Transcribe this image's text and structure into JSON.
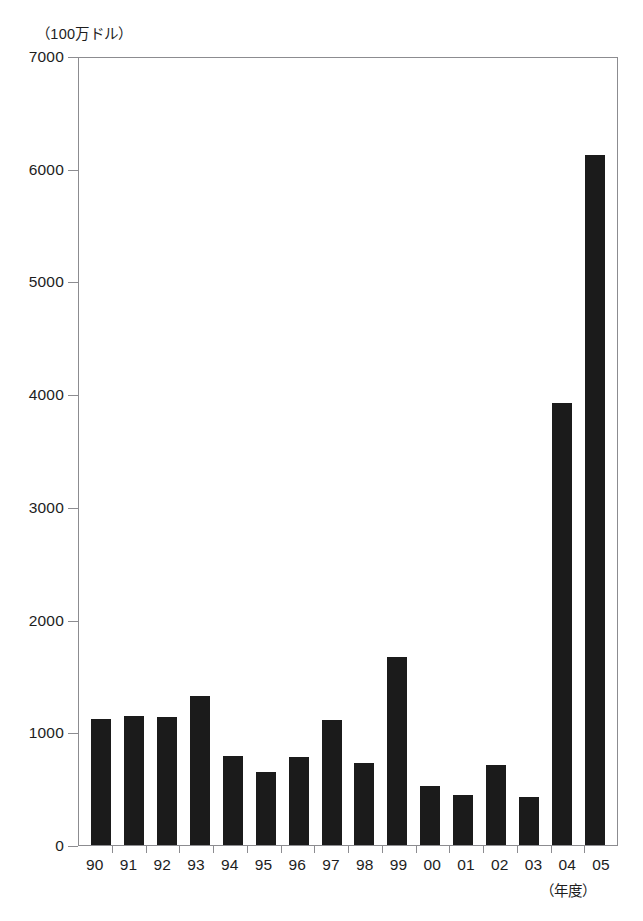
{
  "chart_data": {
    "type": "bar",
    "title": "",
    "subtitle": "",
    "xlabel": "（年度）",
    "ylabel": "（100万ドル）",
    "categories": [
      "90",
      "91",
      "92",
      "93",
      "94",
      "95",
      "96",
      "97",
      "98",
      "99",
      "00",
      "01",
      "02",
      "03",
      "04",
      "05"
    ],
    "values": [
      1120,
      1145,
      1135,
      1320,
      790,
      645,
      780,
      1105,
      725,
      1670,
      520,
      440,
      710,
      425,
      3920,
      6120
    ],
    "series": [
      {
        "name": "",
        "values": [
          1120,
          1145,
          1135,
          1320,
          790,
          645,
          780,
          1105,
          725,
          1670,
          520,
          440,
          710,
          425,
          3920,
          6120
        ]
      }
    ],
    "ylim": [
      0,
      7000
    ],
    "ytick_values": [
      0,
      1000,
      2000,
      3000,
      4000,
      5000,
      6000,
      7000
    ],
    "ytick_labels": [
      "0",
      "1000",
      "2000",
      "3000",
      "4000",
      "5000",
      "6000",
      "7000"
    ],
    "grid": false,
    "legend": null,
    "legend_position": "none",
    "bar_color": "#1b1b1b",
    "axis_color": "#8c8c90",
    "background_color": "#ffffff"
  },
  "axes": {
    "y_unit_label": "（100万ドル）",
    "x_unit_label": "（年度）"
  },
  "footnote": {
    "text": ""
  }
}
